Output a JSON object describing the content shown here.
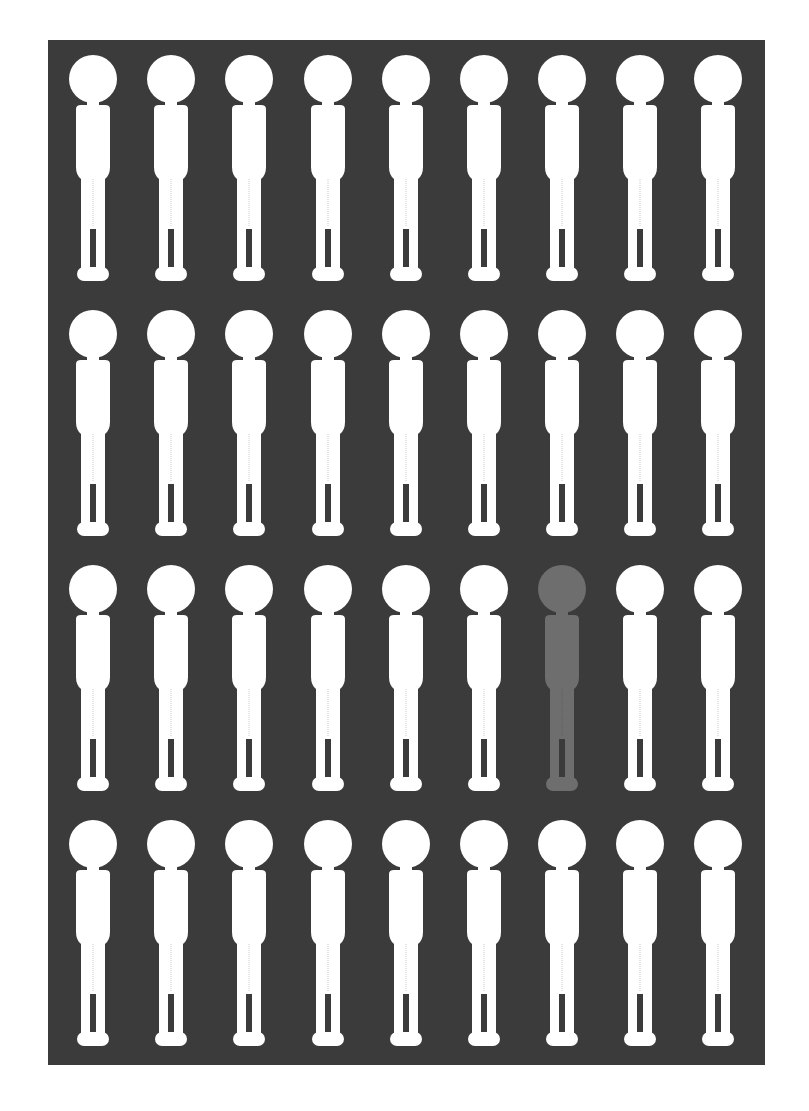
{
  "chart_data": {
    "type": "pictograph",
    "title": "",
    "rows": 4,
    "columns": 9,
    "total_icons": 36,
    "highlighted_count": 1,
    "highlighted_positions": [
      {
        "row": 3,
        "column": 7
      }
    ],
    "ratio_label": "1 in 36",
    "values": [
      1,
      35
    ],
    "categories": [
      "highlighted",
      "other"
    ],
    "colors": {
      "background": "#3b3b3b",
      "figure_default": "#ffffff",
      "figure_highlight": "#6e6e6e",
      "page": "#ffffff"
    },
    "legend": [],
    "xlabel": "",
    "ylabel": ""
  },
  "layout": {
    "col_centers": [
      93,
      171,
      249,
      328,
      406,
      484,
      562,
      640,
      718
    ],
    "row_tops": [
      55,
      310,
      565,
      820
    ],
    "panel_left": 48,
    "panel_top": 40
  }
}
